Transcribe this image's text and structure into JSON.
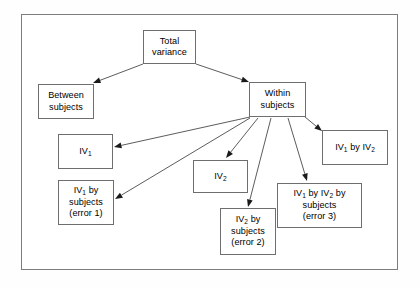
{
  "diagram": {
    "frame": {
      "visible": true,
      "color": "#7d7d7d"
    },
    "nodes": [
      {
        "id": "total_variance",
        "label": "Total\nvariance",
        "x": 143,
        "y": 30,
        "w": 53,
        "h": 34
      },
      {
        "id": "between_subjects",
        "label": "Between\nsubjects",
        "x": 38,
        "y": 84,
        "w": 56,
        "h": 35
      },
      {
        "id": "within_subjects",
        "label": "Within\nsubjects",
        "x": 249,
        "y": 82,
        "w": 57,
        "h": 35
      },
      {
        "id": "iv1",
        "label": "IV@1@",
        "x": 58,
        "y": 134,
        "w": 55,
        "h": 35
      },
      {
        "id": "iv1_by_subjects",
        "label": "IV@1@ by\nsubjects\n(error 1)",
        "x": 58,
        "y": 180,
        "w": 56,
        "h": 45
      },
      {
        "id": "iv2",
        "label": "IV@2@",
        "x": 193,
        "y": 160,
        "w": 55,
        "h": 33
      },
      {
        "id": "iv2_by_subjects",
        "label": "IV@2@ by\nsubjects\n(error 2)",
        "x": 220,
        "y": 208,
        "w": 56,
        "h": 47
      },
      {
        "id": "iv1_by_iv2",
        "label": "IV@1@ by IV@2@",
        "x": 322,
        "y": 130,
        "w": 66,
        "h": 35
      },
      {
        "id": "iv1_iv2_by_subjects",
        "label": "IV@1@ by IV@2@ by\nsubjects\n(error 3)",
        "x": 277,
        "y": 183,
        "w": 85,
        "h": 45
      }
    ],
    "edges": [
      {
        "id": "total-to-between",
        "from": "total_variance",
        "to": "between_subjects",
        "x1": 143,
        "y1": 64,
        "x2": 93,
        "y2": 83
      },
      {
        "id": "total-to-within",
        "from": "total_variance",
        "to": "within_subjects",
        "x1": 196,
        "y1": 64,
        "x2": 249,
        "y2": 82
      },
      {
        "id": "within-to-iv1",
        "from": "within_subjects",
        "to": "iv1",
        "x1": 250,
        "y1": 117,
        "x2": 114,
        "y2": 147
      },
      {
        "id": "within-to-iv1subj",
        "from": "within_subjects",
        "to": "iv1_by_subjects",
        "x1": 250,
        "y1": 118,
        "x2": 115,
        "y2": 199
      },
      {
        "id": "within-to-iv2",
        "from": "within_subjects",
        "to": "iv2",
        "x1": 258,
        "y1": 118,
        "x2": 226,
        "y2": 158
      },
      {
        "id": "within-to-iv2subj",
        "from": "within_subjects",
        "to": "iv2_by_subjects",
        "x1": 271,
        "y1": 118,
        "x2": 248,
        "y2": 207
      },
      {
        "id": "within-to-inter",
        "from": "within_subjects",
        "to": "iv1_iv2_by_subjects",
        "x1": 288,
        "y1": 118,
        "x2": 307,
        "y2": 181
      },
      {
        "id": "within-to-iv1iv2",
        "from": "within_subjects",
        "to": "iv1_by_iv2",
        "x1": 305,
        "y1": 117,
        "x2": 322,
        "y2": 131
      }
    ],
    "style": {
      "edge_color": "#4a4a4a",
      "node_border": "#6e6e6e",
      "node_fill": "#ffffff",
      "text_color": "#000000"
    }
  }
}
